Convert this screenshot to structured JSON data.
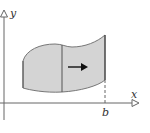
{
  "diagram": {
    "axes": {
      "x_label": "x",
      "y_label": "y",
      "tick_label": "b"
    },
    "colors": {
      "region_fill": "#d4d4d4",
      "stroke": "#555555",
      "axis": "#666666"
    },
    "elements": [
      "shaded region bounded by curves",
      "vertical slice line",
      "right-pointing arrow",
      "dashed line to b on x-axis"
    ]
  }
}
